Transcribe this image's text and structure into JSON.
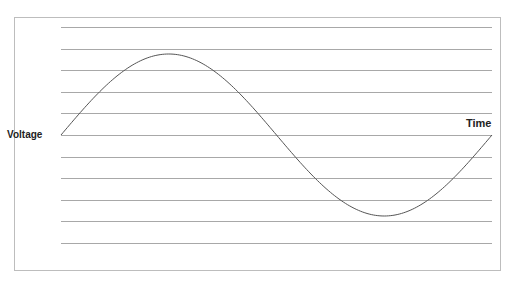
{
  "diagram": {
    "y_axis_label": "Voltage",
    "x_axis_label": "Time",
    "waveform": "sine",
    "cycles": 1,
    "gridline_count": 11,
    "colors": {
      "gridline": "#a8a8a8",
      "curve": "#555555",
      "frame": "#bdbdbd",
      "text": "#222222"
    }
  },
  "chart_data": {
    "type": "line",
    "title": "",
    "xlabel": "Time",
    "ylabel": "Voltage",
    "x": [
      0,
      0.25,
      0.5,
      0.75,
      1.0
    ],
    "values": [
      0,
      1,
      0,
      -1,
      0
    ],
    "grid": true,
    "legend": "none"
  }
}
